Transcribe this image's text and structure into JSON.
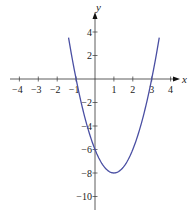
{
  "chart_data": {
    "type": "line",
    "title": "",
    "function": "y = 2x^2 - 4x - 6",
    "xlabel": "x",
    "ylabel": "y",
    "xlim": [
      -4.5,
      4.5
    ],
    "ylim": [
      -10.5,
      5.5
    ],
    "grid": false,
    "x_ticks": [
      -4,
      -3,
      -2,
      -1,
      1,
      2,
      3,
      4
    ],
    "x_tick_labels": [
      "−4",
      "−3",
      "−2",
      "−1",
      "1",
      "2",
      "3",
      "4"
    ],
    "y_ticks": [
      4,
      2,
      -2,
      -4,
      -6,
      -8,
      -10
    ],
    "y_tick_labels": [
      "4",
      "2",
      "−2",
      "−4",
      "−6",
      "−8",
      "−10"
    ],
    "series": [
      {
        "name": "parabola",
        "color": "#4a4fa3",
        "x": [
          -1.4,
          -1,
          0,
          1,
          2,
          3,
          3.4
        ],
        "y": [
          4.72,
          0,
          -6,
          -8,
          -6,
          0,
          4.72
        ]
      }
    ],
    "key_points": {
      "x_intercepts": [
        -1,
        3
      ],
      "y_intercept": -6,
      "vertex": [
        1,
        -8
      ]
    }
  }
}
